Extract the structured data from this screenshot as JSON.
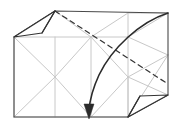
{
  "figure": {
    "type": "origami-crease-pattern",
    "canvas": {
      "width": 181,
      "height": 132,
      "background": "#ffffff"
    },
    "colors": {
      "crease_line": "#c8c8c8",
      "outline": "#4a4a4a",
      "flap_edge": "#333333",
      "fold_dashed": "#333333",
      "arrow": "#2b2b2b"
    },
    "stroke_widths": {
      "crease_line": 1,
      "outline": 1.1,
      "flap_edge": 1.2,
      "fold_dashed": 1.2,
      "arrow": 1.6
    },
    "dash_pattern": "5,4"
  },
  "geometry": {
    "sheet_outline": "M 14,37 L 55,11 L 168,13 L 168,95 L 128,117 L 14,117 Z",
    "body_rect": "M 14,37 L 128,37 L 128,117 L 14,117 Z",
    "top_band": "M 14,37 L 55,11 L 168,13 L 128,37 Z",
    "right_band": "M 128,37 L 168,13 L 168,95 L 128,117 Z",
    "crease_lines": [
      "M 14,37 L 128,37",
      "M 14,117 L 128,117",
      "M 14,37 L 14,117",
      "M 128,37 L 128,117",
      "M 55,37 L 55,117",
      "M 91,37 L 91,117",
      "M 14,37 L 55,77",
      "M 55,77 L 91,37",
      "M 91,37 L 128,77",
      "M 55,77 L 91,117",
      "M 14,117 L 55,77",
      "M 91,117 L 128,77",
      "M 128,77 L 168,55",
      "M 128,37 L 168,55",
      "M 168,55 L 128,117",
      "M 55,11 L 14,37",
      "M 55,11 L 91,37",
      "M 91,37 L 128,13",
      "M 128,13 L 168,13",
      "M 128,13 L 128,37",
      "M 168,13 L 128,37",
      "M 168,95 L 128,77",
      "M 128,77 L 128,117"
    ],
    "flap_top_left": "M 55,11 L 14,37 L 42,33 Z",
    "flap_top_left_spine": "M 55,11 L 42,33",
    "flap_bottom_right": "M 128,117 L 168,95 L 140,96 Z",
    "flap_bottom_right_spine": "M 128,117 L 140,96",
    "dashed_fold": "M 55,11 L 168,84",
    "arrow_path": "M 168,13 C 140,22 112,48 99,75 C 93,88 90,98 89,110",
    "arrow_head": "M 89,119 L 84,104 L 94,104 Z"
  },
  "labels": {
    "step_caption": "",
    "annotations": []
  }
}
